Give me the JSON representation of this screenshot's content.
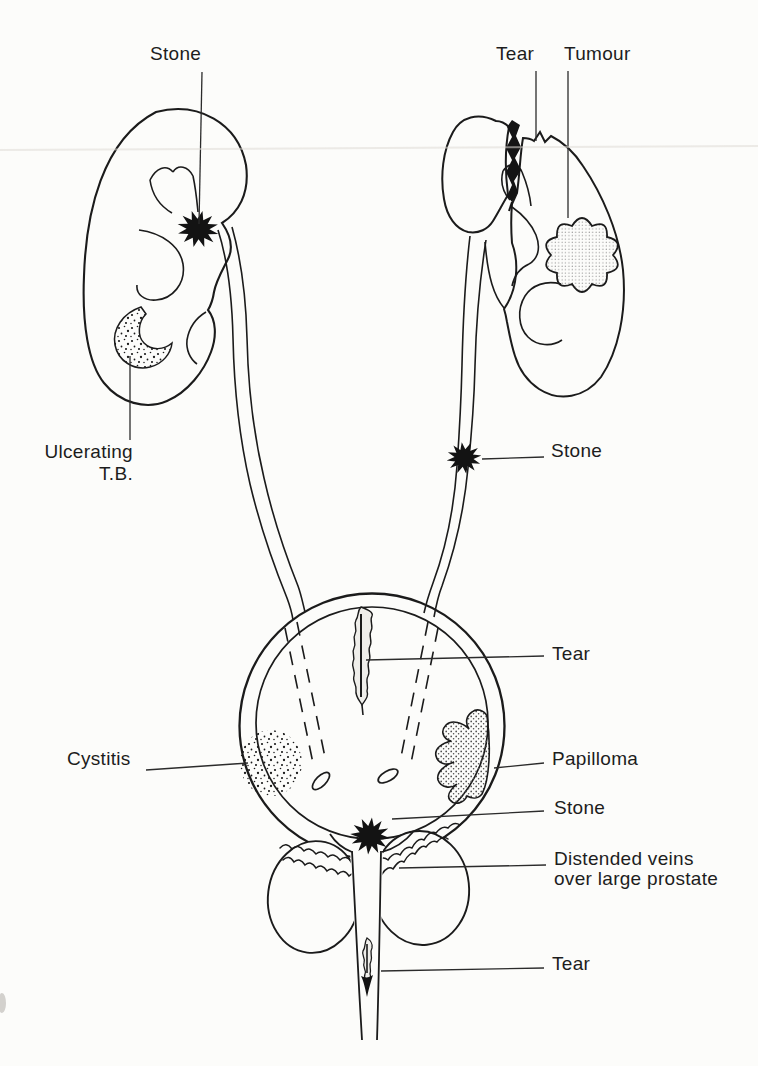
{
  "diagram": {
    "colors": {
      "ink": "#1b1b1b",
      "paper": "#fcfcfa"
    },
    "labels": {
      "left_kidney_stone": "Stone",
      "right_kidney_tear": "Tear",
      "right_kidney_tumour": "Tumour",
      "ulcerating_tb": {
        "line1": "Ulcerating",
        "line2": "T.B."
      },
      "right_ureter_stone": "Stone",
      "bladder_tear": "Tear",
      "cystitis": "Cystitis",
      "papilloma": "Papilloma",
      "bladder_neck_stone": "Stone",
      "prostate_veins": {
        "line1": "Distended veins",
        "line2": "over large prostate"
      },
      "urethra_tear": "Tear"
    }
  }
}
